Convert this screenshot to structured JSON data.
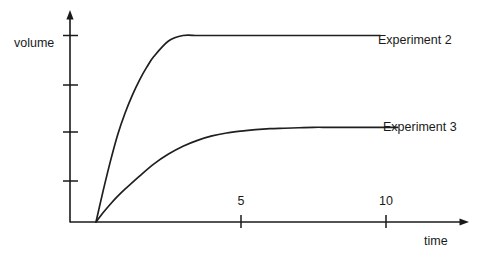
{
  "chart_data": {
    "type": "line",
    "title": "",
    "subtitle": "",
    "xlabel": "time",
    "ylabel": "volume",
    "xlim": [
      0,
      13.75
    ],
    "ylim": [
      0,
      4.3
    ],
    "grid": false,
    "legend_position": "right-inline-labels",
    "x_tick_labels": [
      "5",
      "10"
    ],
    "x_tick_values": [
      5,
      10
    ],
    "y_tick_labels": [
      "",
      "",
      "",
      ""
    ],
    "y_tick_values": [
      1,
      2,
      3,
      4
    ],
    "annotations": [
      "Experiment 2",
      "Experiment 3"
    ],
    "series": [
      {
        "name": "Experiment 2",
        "label": "Experiment 2",
        "color": "#1f1f1f",
        "plateau": 4,
        "x_end": 9.8,
        "model": "saturating-exponential",
        "x": [
          0,
          0.25,
          0.5,
          0.75,
          1,
          1.25,
          1.5,
          1.75,
          2,
          2.5,
          3,
          3.5,
          4,
          4.5,
          5,
          5.5,
          6,
          6.5,
          7,
          7.5,
          8,
          8.5,
          9,
          9.4,
          9.8
        ],
        "y": [
          0,
          0.77,
          1.41,
          1.95,
          2.4,
          2.78,
          3.1,
          3.36,
          3.58,
          3.89,
          4.06,
          4.14,
          4.18,
          4.19,
          4.2,
          4.2,
          4.2,
          4.2,
          4.2,
          4.2,
          4.2,
          4.2,
          4.2,
          4.2,
          4.2
        ]
      },
      {
        "name": "Experiment 3",
        "label": "Experiment 3",
        "color": "#1f1f1f",
        "plateau": 2,
        "x_end": 10.4,
        "model": "saturating-exponential",
        "x": [
          0,
          0.25,
          0.5,
          0.75,
          1,
          1.5,
          2,
          2.5,
          3,
          3.5,
          4,
          4.5,
          5,
          5.5,
          6,
          6.5,
          7,
          7.5,
          8,
          8.5,
          9,
          9.5,
          10,
          10.4
        ],
        "y": [
          0,
          0.23,
          0.44,
          0.63,
          0.8,
          1.1,
          1.35,
          1.55,
          1.71,
          1.83,
          1.92,
          1.98,
          2.02,
          2.05,
          2.07,
          2.08,
          2.09,
          2.1,
          2.1,
          2.1,
          2.1,
          2.1,
          2.1,
          2.1
        ]
      }
    ]
  }
}
